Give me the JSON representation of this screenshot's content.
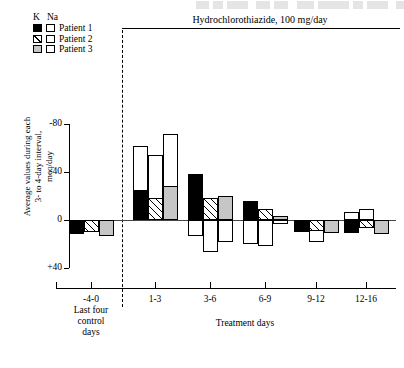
{
  "figure": {
    "treatment_title": "Hydrochlorothiazide, 100 mg/day",
    "y_axis_title": "Average values during each 3- to 4-day interval, meq/day",
    "x_axis_title": "Treatment days",
    "control_caption_lines": [
      "Last four",
      "control",
      "days"
    ]
  },
  "legend": {
    "col_k": "K",
    "col_na": "Na",
    "rows": [
      {
        "label": "Patient 1",
        "k_swatch": "black",
        "na_swatch": "white"
      },
      {
        "label": "Patient 2",
        "k_swatch": "hatch",
        "na_swatch": "white"
      },
      {
        "label": "Patient 3",
        "k_swatch": "gray",
        "na_swatch": "white"
      }
    ]
  },
  "axes": {
    "y_ticks": [
      "-80",
      "-40",
      "0",
      "+40"
    ],
    "y_tick_values": [
      -80,
      -40,
      0,
      40
    ],
    "y_min": -88,
    "y_max": 46,
    "x_categories": [
      "-4-0",
      "1-3",
      "3-6",
      "6-9",
      "9-12",
      "12-16"
    ]
  },
  "chart_data": {
    "type": "bar",
    "title": "Hydrochlorothiazide, 100 mg/day",
    "xlabel": "Treatment days",
    "ylabel": "Average values during each 3- to 4-day interval, meq/day",
    "ylim": [
      -88,
      46
    ],
    "y_inverted": true,
    "grid": false,
    "legend_position": "top-left",
    "note": "Negative values plot upward (axis inverted). Each patient has a paired K bar (filled) and Na bar (open/white); in the 1-3 interval the Na bar is drawn behind/above the K bar as a stacked pair.",
    "categories": [
      "-4-0",
      "1-3",
      "3-6",
      "6-9",
      "9-12",
      "12-16"
    ],
    "series": [
      {
        "name": "Patient 1 K",
        "fill": "black",
        "element": "K",
        "values": [
          12,
          -25,
          -38,
          -16,
          10,
          11
        ]
      },
      {
        "name": "Patient 2 K",
        "fill": "hatch",
        "element": "K",
        "values": [
          10,
          -18,
          -18,
          -9,
          9,
          7
        ]
      },
      {
        "name": "Patient 3 K",
        "fill": "gray",
        "element": "K",
        "values": [
          13,
          -28,
          -20,
          -3,
          11,
          12
        ]
      },
      {
        "name": "Patient 1 Na",
        "fill": "white",
        "element": "Na",
        "values": [
          0,
          -62,
          13,
          20,
          6,
          -7
        ]
      },
      {
        "name": "Patient 2 Na",
        "fill": "white",
        "element": "Na",
        "values": [
          0,
          -54,
          27,
          22,
          18,
          -9
        ]
      },
      {
        "name": "Patient 3 Na",
        "fill": "white",
        "element": "Na",
        "values": [
          0,
          -72,
          18,
          3,
          4,
          2
        ]
      }
    ]
  }
}
